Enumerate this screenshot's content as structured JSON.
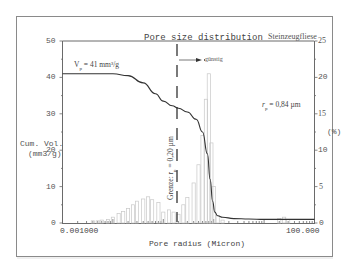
{
  "chart_data": {
    "type": "line",
    "title": "Pore size distribution",
    "sample_label": "Steinzeugfliese",
    "xlabel": "Pore radius (Micron)",
    "x_scale": "log",
    "xlim": [
      0.001,
      100.0
    ],
    "x_tick_labels": [
      "0.001000",
      "100.000"
    ],
    "ylabel_left": "Cum. Vol. (mm3/g)",
    "ylim_left": [
      0,
      50
    ],
    "y_ticks_left": [
      0,
      10,
      20,
      30,
      40,
      50
    ],
    "ylabel_right": "(%)",
    "ylim_right": [
      0,
      25
    ],
    "y_ticks_right": [
      0,
      5,
      10,
      15,
      20,
      25
    ],
    "grid": false,
    "annotations": [
      {
        "text": "Vp = 41 mm³/g",
        "meaning": "total pore volume"
      },
      {
        "text": "rp = 0,84 µm",
        "meaning": "mean pore radius"
      },
      {
        "text": "Grenze: rp = 0,20 µm",
        "meaning": "vertical dashed boundary at 0.20 µm"
      },
      {
        "text": "günstig",
        "meaning": "arrow pointing right (favourable region)"
      }
    ],
    "series": [
      {
        "name": "Cumulative volume",
        "axis": "left",
        "kind": "line",
        "x": [
          0.001,
          0.003,
          0.01,
          0.02,
          0.04,
          0.07,
          0.1,
          0.15,
          0.2,
          0.3,
          0.45,
          0.6,
          0.75,
          0.85,
          0.95,
          1.05,
          1.2,
          1.5,
          2.5,
          5,
          10,
          30,
          100
        ],
        "y": [
          41,
          41,
          41,
          40.5,
          38.5,
          35.5,
          33.5,
          32.2,
          31.5,
          30.5,
          28.5,
          25,
          19,
          12,
          6,
          3,
          2,
          1.6,
          1.2,
          1.1,
          1.0,
          1.0,
          1.0
        ]
      },
      {
        "name": "Incremental distribution (%)",
        "axis": "right",
        "kind": "histogram",
        "x": [
          0.004,
          0.005,
          0.006,
          0.008,
          0.01,
          0.013,
          0.016,
          0.02,
          0.025,
          0.03,
          0.04,
          0.05,
          0.06,
          0.08,
          0.1,
          0.13,
          0.16,
          0.2,
          0.25,
          0.3,
          0.4,
          0.5,
          0.6,
          0.7,
          0.8,
          0.9,
          1.0,
          1.2,
          1.5,
          20,
          25,
          30
        ],
        "y": [
          0.3,
          0.3,
          0.4,
          0.5,
          0.8,
          1.3,
          1.6,
          2.0,
          2.5,
          3.0,
          3.3,
          3.6,
          3.2,
          2.8,
          1.5,
          1.8,
          1.5,
          1.2,
          2.5,
          3.5,
          5.5,
          8.0,
          12.0,
          17.0,
          20.5,
          11.0,
          5.0,
          1.0,
          0.4,
          0.6,
          0.8,
          0.5
        ]
      }
    ]
  },
  "labels": {
    "title": "Pore size distribution",
    "sample": "Steinzeugfliese",
    "xlabel": "Pore radius (Micron)",
    "x_min": "0.001000",
    "x_max": "100.000",
    "ylabel_left_1": "Cum. Vol.",
    "ylabel_left_2": "(mm3/g)",
    "ylabel_right": "(%)",
    "vp": "V",
    "vp_sub": "p",
    "vp_rest": " = 41 mm³/g",
    "rp": "r",
    "rp_sub": "p",
    "rp_rest": " = 0,84 µm",
    "grenze": "Grenze: r",
    "grenze_sub": "p",
    "grenze_rest": " = 0,20 µm",
    "guenstig": "günstig",
    "left_ticks": [
      "50",
      "40",
      "30",
      "20",
      "10",
      "0"
    ],
    "right_ticks": [
      "25",
      "20",
      "15",
      "10",
      "5",
      "0"
    ]
  },
  "colors": {
    "frame": "#8a8a8a",
    "axis": "#6a6a6a",
    "curve": "#333333",
    "histogram": "#c8c8c8",
    "text": "#555555"
  }
}
